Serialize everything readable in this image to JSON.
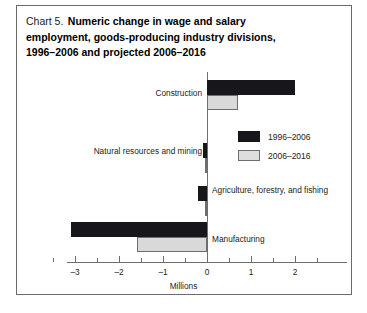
{
  "chart_data": {
    "type": "bar",
    "orientation": "horizontal",
    "title_prefix": "Chart 5.",
    "title": "Numeric change in wage and salary employment, goods-producing industry divisions, 1996–2006 and projected 2006–2016",
    "title_lines": [
      "Numeric change in wage and salary",
      "employment, goods-producing industry divisions,",
      "1996–2006 and projected 2006–2016"
    ],
    "xlabel": "Millions",
    "ylabel": "",
    "xlim": [
      -3.3,
      3.3
    ],
    "grid": false,
    "legend_position": "center-right",
    "categories": [
      "Construction",
      "Natural resources and mining",
      "Agriculture, forestry, and fishing",
      "Manufacturing"
    ],
    "series": [
      {
        "name": "1996–2006",
        "color": "#17161a",
        "values": [
          2.0,
          -0.1,
          -0.2,
          -3.1
        ]
      },
      {
        "name": "2006–2016",
        "color": "#d9d9d9",
        "values": [
          0.7,
          -0.02,
          -0.05,
          -1.6
        ]
      }
    ],
    "xticks": [
      -3,
      -2,
      -1,
      0,
      1,
      2
    ],
    "xtick_labels": [
      "–3",
      "–2",
      "–1",
      "0",
      "1",
      "2"
    ],
    "xticks_minor": [
      -3.5,
      -2.5,
      -1.5,
      -0.5,
      0.5,
      1.5,
      2.5
    ]
  },
  "legend": {
    "items": [
      {
        "label": "1996–2006",
        "style": "past"
      },
      {
        "label": "2006–2016",
        "style": "proj"
      }
    ]
  },
  "colors": {
    "series_past": "#17161a",
    "series_projected": "#d9d9d9",
    "axis": "#6e6e6e",
    "text": "#1b1b1b",
    "frame": "#6b6b6b",
    "background": "#ffffff"
  }
}
